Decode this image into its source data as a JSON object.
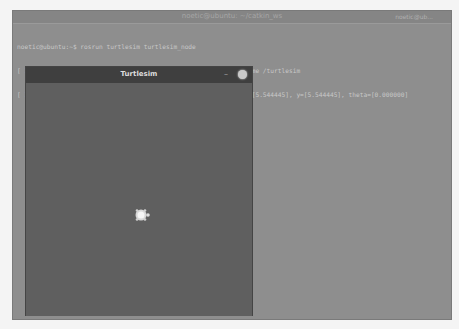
{
  "terminal": {
    "title": "noetic@ubuntu: ~/catkin_ws",
    "user_label": "noetic@ub...",
    "lines": [
      "noetic@ubuntu:~$ rosrun turtlesim turtlesim_node",
      "[ INFO] [1604934935.956530848]: Starting turtlesim with node name /turtlesim",
      "[ INFO] [1604934935.966247972]: Spawning turtle [turtle1] at x=[5.544445], y=[5.544445], theta=[0.000000]"
    ]
  },
  "turtlesim": {
    "title": "Turtlesim",
    "minimize_label": "–",
    "background_color": "#5f5f5f",
    "turtle": {
      "name": "turtle1",
      "x": 5.544445,
      "y": 5.544445,
      "theta": 0.0
    }
  }
}
